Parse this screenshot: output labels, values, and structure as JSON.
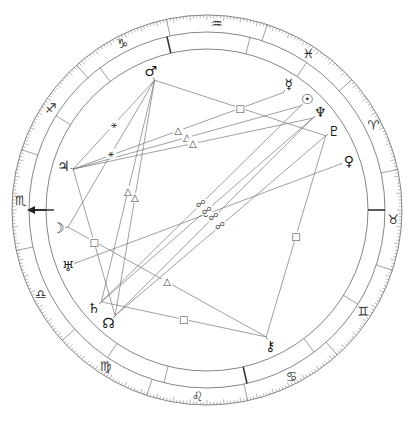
{
  "signs": [
    {
      "name": "aries",
      "glyph": "♈"
    },
    {
      "name": "taurus",
      "glyph": "♉"
    },
    {
      "name": "gemini",
      "glyph": "♊"
    },
    {
      "name": "cancer",
      "glyph": "♋"
    },
    {
      "name": "leo",
      "glyph": "♌"
    },
    {
      "name": "virgo",
      "glyph": "♍"
    },
    {
      "name": "libra",
      "glyph": "♎"
    },
    {
      "name": "scorpio",
      "glyph": "♏"
    },
    {
      "name": "sagittarius",
      "glyph": "♐"
    },
    {
      "name": "capricorn",
      "glyph": "♑"
    },
    {
      "name": "aquarius",
      "glyph": "♒"
    },
    {
      "name": "pisces",
      "glyph": "♓"
    }
  ],
  "ascendant_sign": "scorpio",
  "ascendant_marker": "arrow",
  "planets": [
    {
      "name": "mercury",
      "glyph": "☿",
      "angle_deg": 57
    },
    {
      "name": "sun",
      "glyph": "☉",
      "angle_deg": 48
    },
    {
      "name": "neptune",
      "glyph": "♆",
      "angle_deg": 41
    },
    {
      "name": "pluto",
      "glyph": "♇",
      "angle_deg": 32
    },
    {
      "name": "venus",
      "glyph": "♀",
      "angle_deg": 19
    },
    {
      "name": "mars",
      "glyph": "♂",
      "angle_deg": 112
    },
    {
      "name": "jupiter",
      "glyph": "♃",
      "angle_deg": 163
    },
    {
      "name": "moon",
      "glyph": "☽",
      "angle_deg": 187
    },
    {
      "name": "uranus",
      "glyph": "♅",
      "angle_deg": 202
    },
    {
      "name": "saturn",
      "glyph": "♄",
      "angle_deg": 221
    },
    {
      "name": "north-node",
      "glyph": "☊",
      "angle_deg": 229
    },
    {
      "name": "chiron",
      "glyph": "⚷",
      "angle_deg": 295
    }
  ],
  "aspects": [
    {
      "from": "mars",
      "to": "jupiter",
      "type": "sextile",
      "glyph": "⚹"
    },
    {
      "from": "mars",
      "to": "north-node",
      "type": "trine",
      "glyph": "△"
    },
    {
      "from": "mars",
      "to": "saturn",
      "type": "trine",
      "glyph": "△"
    },
    {
      "from": "mars",
      "to": "pluto",
      "type": "square",
      "glyph": "□"
    },
    {
      "from": "jupiter",
      "to": "mercury",
      "type": "trine",
      "glyph": "△"
    },
    {
      "from": "jupiter",
      "to": "sun",
      "type": "trine",
      "glyph": "△"
    },
    {
      "from": "jupiter",
      "to": "neptune",
      "type": "trine",
      "glyph": "△"
    },
    {
      "from": "jupiter",
      "to": "north-node",
      "type": "square",
      "glyph": "□"
    },
    {
      "from": "moon",
      "to": "chiron",
      "type": "trine",
      "glyph": "△"
    },
    {
      "from": "moon",
      "to": "mars",
      "type": "sextile",
      "glyph": "⚹"
    },
    {
      "from": "uranus",
      "to": "venus",
      "type": "opposition",
      "glyph": "☍"
    },
    {
      "from": "saturn",
      "to": "sun",
      "type": "opposition",
      "glyph": "☍"
    },
    {
      "from": "saturn",
      "to": "neptune",
      "type": "opposition",
      "glyph": "☍"
    },
    {
      "from": "saturn",
      "to": "chiron",
      "type": "square",
      "glyph": "□"
    },
    {
      "from": "north-node",
      "to": "neptune",
      "type": "opposition",
      "glyph": "☍"
    },
    {
      "from": "north-node",
      "to": "pluto",
      "type": "opposition",
      "glyph": "☍"
    },
    {
      "from": "chiron",
      "to": "pluto",
      "type": "square",
      "glyph": "□"
    }
  ],
  "house_cusps_deg": [
    180,
    148,
    127,
    103,
    76,
    56,
    0,
    328,
    307,
    283,
    256,
    236
  ],
  "angle_cusps_deg": [
    0,
    103,
    180,
    283
  ]
}
